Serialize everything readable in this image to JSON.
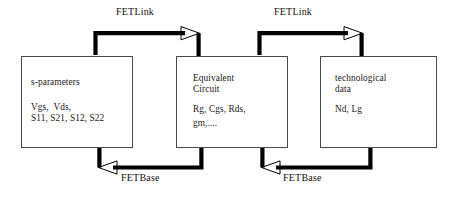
{
  "diagram": {
    "background_color": "#ffffff",
    "line_color": "#000000",
    "box_border_color": "#4a4a4a",
    "text_color": "#1a1a1a",
    "boxes": [
      {
        "id": "s-parameters",
        "heading": "s-parameters",
        "lines": [
          "Vgs,  Vds,",
          "S11, S21, S12, S22"
        ]
      },
      {
        "id": "equivalent-circuit",
        "heading": "Equivalent\nCircuit",
        "lines": [
          "Rg, Cgs, Rds,",
          "gm,...."
        ]
      },
      {
        "id": "technological-data",
        "heading": "technological\ndata",
        "lines": [
          "Nd, Lg"
        ]
      }
    ],
    "connections": [
      {
        "id": "link-1",
        "label": "FETLink",
        "from": "s-parameters",
        "to": "equivalent-circuit",
        "direction": "right"
      },
      {
        "id": "link-2",
        "label": "FETLink",
        "from": "equivalent-circuit",
        "to": "technological-data",
        "direction": "right"
      },
      {
        "id": "base-1",
        "label": "FETBase",
        "from": "equivalent-circuit",
        "to": "s-parameters",
        "direction": "left"
      },
      {
        "id": "base-2",
        "label": "FETBase",
        "from": "technological-data",
        "to": "equivalent-circuit",
        "direction": "left"
      }
    ]
  }
}
